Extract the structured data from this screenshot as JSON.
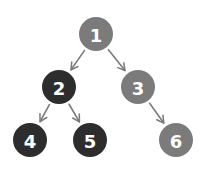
{
  "diagram": {
    "type": "binary-tree",
    "colors": {
      "gray_node": "#7b7b7b",
      "dark_node": "#2d2d2d",
      "edge": "#7b7b7b",
      "label": "#ffffff",
      "background": "#ffffff"
    },
    "nodes": [
      {
        "id": "1",
        "label": "1",
        "x": 96,
        "y": 34,
        "style": "gray"
      },
      {
        "id": "2",
        "label": "2",
        "x": 59,
        "y": 87,
        "style": "dark"
      },
      {
        "id": "3",
        "label": "3",
        "x": 138,
        "y": 87,
        "style": "gray"
      },
      {
        "id": "4",
        "label": "4",
        "x": 30,
        "y": 140,
        "style": "dark"
      },
      {
        "id": "5",
        "label": "5",
        "x": 90,
        "y": 140,
        "style": "dark"
      },
      {
        "id": "6",
        "label": "6",
        "x": 176,
        "y": 140,
        "style": "gray"
      }
    ],
    "edges": [
      {
        "from": "1",
        "to": "2"
      },
      {
        "from": "1",
        "to": "3"
      },
      {
        "from": "2",
        "to": "4"
      },
      {
        "from": "2",
        "to": "5"
      },
      {
        "from": "3",
        "to": "6"
      }
    ]
  }
}
